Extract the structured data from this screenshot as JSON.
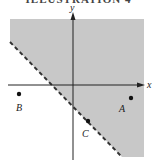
{
  "title": "ILLUSTRATION 4",
  "axes": {
    "x_label": "x",
    "y_label": "y"
  },
  "region": {
    "fill": "#c8c8c8",
    "boundary": "dashed",
    "shaded_side": "above-right of line"
  },
  "points": [
    {
      "name": "A",
      "label": "A"
    },
    {
      "name": "B",
      "label": "B"
    },
    {
      "name": "C",
      "label": "C"
    }
  ]
}
